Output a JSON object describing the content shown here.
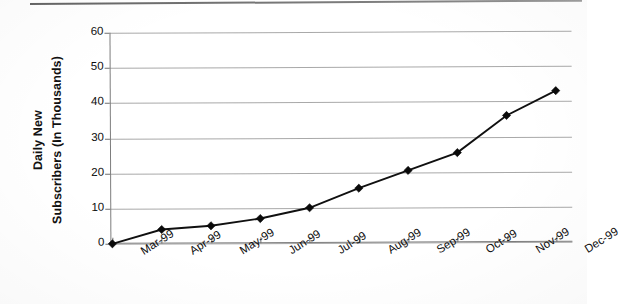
{
  "document": {
    "kind": "scanned-line-chart",
    "background_color": "#ffffff",
    "ink_color": "#101010",
    "gridline_color": "#9a9a9a"
  },
  "axis_titles": {
    "y_line1": "Daily New",
    "y_line2": "Subscribers (In Thousands)"
  },
  "chart_data": {
    "type": "line",
    "title": "",
    "subtitle": "",
    "xlabel": "",
    "ylabel": "Daily New Subscribers (In Thousands)",
    "categories": [
      "Mar-99",
      "Apr-99",
      "May-99",
      "Jun-99",
      "Jul-99",
      "Aug-99",
      "Sep-99",
      "Oct-99",
      "Nov-99",
      "Dec-99"
    ],
    "values": [
      0,
      4,
      5,
      7,
      10,
      15.5,
      20.5,
      25.5,
      36,
      43
    ],
    "series": [
      {
        "name": "Daily New Subscribers",
        "values": [
          0,
          4,
          5,
          7,
          10,
          15.5,
          20.5,
          25.5,
          36,
          43
        ]
      }
    ],
    "ylim": [
      0,
      60
    ],
    "yticks": [
      0,
      10,
      20,
      30,
      40,
      50,
      60
    ],
    "ytick_labels": [
      "0",
      "10",
      "20",
      "30",
      "40",
      "50",
      "60"
    ],
    "xtick_labels": [
      "Mar-99",
      "Apr-99",
      "May-99",
      "Jun-99",
      "Jul-99",
      "Aug-99",
      "Sep-99",
      "Oct-99",
      "Nov-99",
      "Dec-99"
    ],
    "grid": true,
    "grid_axis": "y",
    "legend": false,
    "legend_position": "none",
    "marker": "diamond",
    "marker_color": "#0a0a0a",
    "line_color": "#101010",
    "xlabel_rotation_deg": -32,
    "annotations": []
  }
}
